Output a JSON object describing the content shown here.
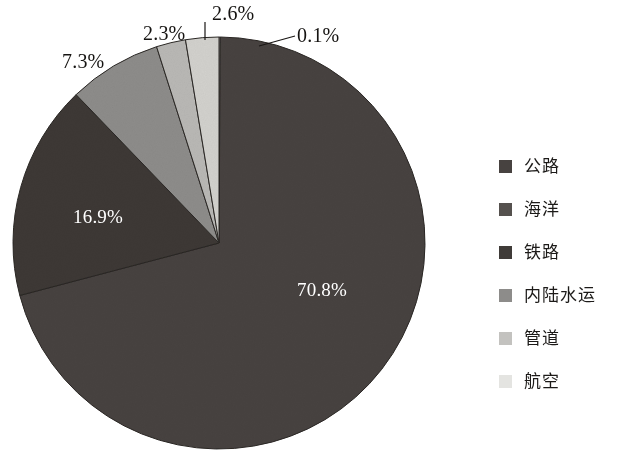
{
  "chart_data": {
    "type": "pie",
    "title": "",
    "categories": [
      "公路",
      "海洋",
      "铁路",
      "内陆水运",
      "管道",
      "航空"
    ],
    "values": [
      70.8,
      16.9,
      7.3,
      2.3,
      2.6,
      0.1
    ],
    "value_labels": [
      "70.8%",
      "16.9%",
      "7.3%",
      "2.3%",
      "2.6%",
      "0.1%"
    ],
    "colors": [
      "#474240",
      "#3c3835",
      "#8d8c8a",
      "#b9b8b5",
      "#d2d1cd",
      "#ebebe8"
    ],
    "legend_position": "right",
    "grid": false,
    "units": "percent",
    "start_angle_deg": 0,
    "direction": "clockwise"
  },
  "slices": {
    "gonglu": {
      "label": "公路",
      "pct": "70.8%",
      "value": 70.8,
      "color": "#474240",
      "label_color": "#ffffff",
      "inside": true
    },
    "haiyang": {
      "label": "海洋",
      "pct": "16.9%",
      "value": 16.9,
      "color": "#3c3835",
      "label_color": "#ffffff",
      "inside": true
    },
    "tielu": {
      "label": "铁路",
      "pct": "7.3%",
      "value": 7.3,
      "color": "#8d8c8a",
      "label_color": "#161412",
      "inside": false
    },
    "neilu": {
      "label": "内陆水运",
      "pct": "2.3%",
      "value": 2.3,
      "color": "#b9b8b5",
      "label_color": "#161412",
      "inside": false
    },
    "guandao": {
      "label": "管道",
      "pct": "2.6%",
      "value": 2.6,
      "color": "#d2d1cd",
      "label_color": "#161412",
      "inside": false
    },
    "hangkong": {
      "label": "航空",
      "pct": "0.1%",
      "value": 0.1,
      "color": "#ebebe8",
      "label_color": "#161412",
      "inside": false
    }
  },
  "legend": {
    "items": [
      {
        "label": "公路",
        "color": "#474240"
      },
      {
        "label": "海洋",
        "color": "#55514e"
      },
      {
        "label": "铁路",
        "color": "#3f3b38"
      },
      {
        "label": "内陆水运",
        "color": "#8d8c8a"
      },
      {
        "label": "管道",
        "color": "#c3c2bf"
      },
      {
        "label": "航空",
        "color": "#e4e4e1"
      }
    ]
  }
}
